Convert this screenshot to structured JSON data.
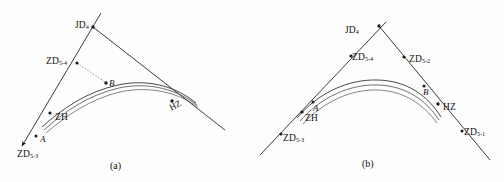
{
  "figure": {
    "background_color": "#fdfdfd",
    "line_color": "#1a1a1a",
    "panels": [
      {
        "id": "a",
        "caption": "(a)",
        "labels": {
          "jd4": "JD",
          "jd4_sub": "4",
          "zd54": "ZD",
          "zd54_sub": "5-4",
          "zd53": "ZD",
          "zd53_sub": "5-3",
          "zh": "ZH",
          "hz": "HZ",
          "point_a": "A",
          "point_b": "B"
        }
      },
      {
        "id": "b",
        "caption": "(b)",
        "labels": {
          "jd4": "JD",
          "jd4_sub": "4",
          "zd54": "ZD",
          "zd54_sub": "5-4",
          "zd52": "ZD",
          "zd52_sub": "5-2",
          "zd53": "ZD",
          "zd53_sub": "5-3",
          "zd51": "ZD",
          "zd51_sub": "5-1",
          "zh": "ZH",
          "hz": "HZ",
          "point_a": "A",
          "point_b": "B"
        }
      }
    ]
  }
}
